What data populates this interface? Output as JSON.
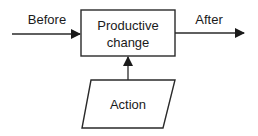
{
  "diagram": {
    "process_box": {
      "line1": "Productive",
      "line2": "change"
    },
    "input_label": "Before",
    "output_label": "After",
    "action_label": "Action",
    "colors": {
      "stroke": "#2a2a2a",
      "text": "#1a1a1a",
      "background": "#ffffff"
    }
  }
}
